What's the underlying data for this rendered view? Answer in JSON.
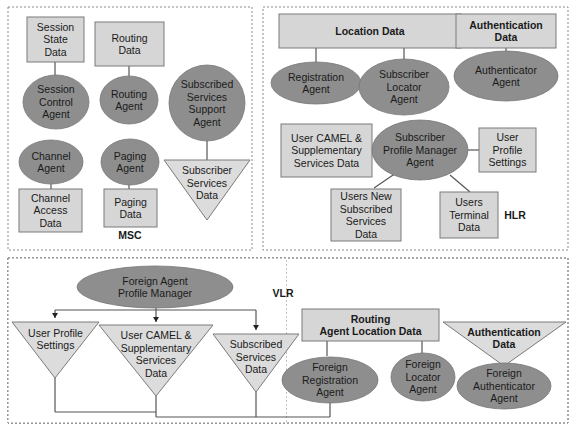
{
  "colors": {
    "data_fill": "#d6d6d6",
    "agent_fill": "#8f8f8f",
    "border": "#777777",
    "line": "#555555"
  },
  "panels": {
    "msc": {
      "label": "MSC",
      "nodes": {
        "session_state_data": "Session\nState\nData",
        "routing_data": "Routing\nData",
        "session_control_agent": "Session\nControl\nAgent",
        "routing_agent": "Routing\nAgent",
        "subscribed_services_support_agent": "Subscribed\nServices\nSupport\nAgent",
        "channel_agent": "Channel\nAgent",
        "paging_agent": "Paging\nAgent",
        "subscriber_services_data": "Subscriber\nServices\nData",
        "channel_access_data": "Channel\nAccess\nData",
        "paging_data": "Paging\nData"
      }
    },
    "hlr": {
      "label": "HLR",
      "nodes": {
        "location_data": "Location Data",
        "authentication_data": "Authentication\nData",
        "registration_agent": "Registration\nAgent",
        "subscriber_locator_agent": "Subscriber\nLocator\nAgent",
        "authenticator_agent": "Authenticator\nAgent",
        "user_camel_data": "User CAMEL &\nSupplementary\nServices Data",
        "subscriber_profile_manager_agent": "Subscriber\nProfile Manager\nAgent",
        "user_profile_settings": "User\nProfile\nSettings",
        "users_new_subscribed_services_data": "Users New\nSubscribed\nServices\nData",
        "users_terminal_data": "Users\nTerminal\nData"
      }
    },
    "vlr": {
      "label": "VLR",
      "nodes": {
        "foreign_agent_profile_manager": "Foreign Agent\nProfile Manager",
        "user_profile_settings": "User Profile\nSettings",
        "user_camel_data": "User CAMEL &\nSupplementary\nServices\nData",
        "subscribed_services_data": "Subscribed\nServices\nData",
        "routing_agent_location_data": "Routing\nAgent Location Data",
        "authentication_data": "Authentication\nData",
        "foreign_registration_agent": "Foreign\nRegistration\nAgent",
        "foreign_locator_agent": "Foreign\nLocator\nAgent",
        "foreign_authenticator_agent": "Foreign\nAuthenticator\nAgent"
      }
    }
  }
}
